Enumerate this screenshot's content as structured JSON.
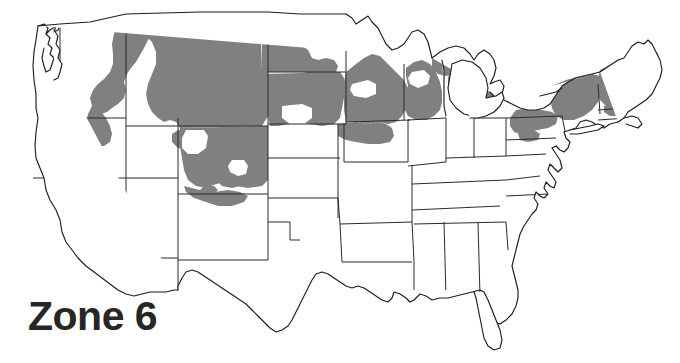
{
  "map": {
    "title": "Zone 6",
    "label_text": "Zone 6",
    "map_type": "USDA Plant Hardiness Zone Map",
    "region": "Continental United States",
    "background_color": "#ffffff",
    "zone_fill_color": "#808080",
    "border_color": "#2b2b2b",
    "label_color": "#262626",
    "legend": {
      "zone_name": "Zone 6",
      "shaded_meaning": "Areas within Zone 6"
    },
    "shaded_regions": [
      "Montana",
      "Northern Idaho",
      "Northeastern Washington",
      "Southeastern North Dakota",
      "South Dakota (northern and eastern)",
      "Northern Nebraska",
      "Northern Wyoming",
      "Colorado mountains",
      "Northern Minnesota",
      "Wisconsin",
      "Michigan Upper Peninsula",
      "Northern Lower Michigan",
      "Eastern Sierra Nevada California",
      "Northern Pennsylvania",
      "Upstate New York",
      "Vermont",
      "New Hampshire",
      "Maine",
      "Western Massachusetts"
    ],
    "unshaded_regions": [
      "California",
      "Oregon",
      "Nevada",
      "Arizona",
      "New Mexico",
      "Texas",
      "Oklahoma",
      "Kansas",
      "Missouri",
      "Arkansas",
      "Louisiana",
      "Mississippi",
      "Alabama",
      "Georgia",
      "Florida",
      "South Carolina",
      "North Carolina",
      "Tennessee",
      "Kentucky",
      "Virginia",
      "West Virginia",
      "Ohio",
      "Indiana",
      "Illinois",
      "Iowa",
      "Maryland",
      "Delaware",
      "New Jersey",
      "Connecticut",
      "Rhode Island",
      "Utah"
    ]
  }
}
